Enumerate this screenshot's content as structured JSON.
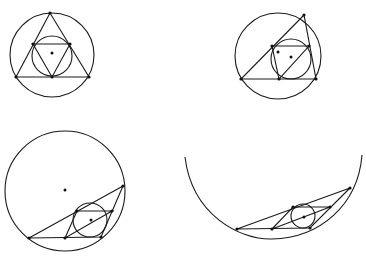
{
  "diagram": {
    "stroke_color": "#1a1a1a",
    "background": "#ffffff",
    "figures": [
      {
        "id": "fig1",
        "outer_circle": {
          "cx": 52,
          "cy": 55,
          "r": 42
        },
        "triangle": [
          [
            50,
            13
          ],
          [
            16,
            77
          ],
          [
            89,
            77
          ]
        ],
        "incircle": {
          "cx": 52,
          "cy": 56,
          "r": 20
        },
        "inner_triangle": [
          [
            33,
            44
          ],
          [
            70,
            44
          ],
          [
            52,
            77
          ]
        ],
        "center_dots": [
          [
            52,
            53
          ]
        ],
        "vertex_dots": [
          [
            50,
            13
          ],
          [
            16,
            77
          ],
          [
            89,
            77
          ],
          [
            33,
            44
          ],
          [
            70,
            44
          ],
          [
            52,
            77
          ]
        ]
      },
      {
        "id": "fig2",
        "outer_circle": {
          "cx": 278,
          "cy": 56,
          "r": 43
        },
        "triangle": [
          [
            304,
            15
          ],
          [
            241,
            79
          ],
          [
            316,
            79
          ]
        ],
        "incircle": {
          "cx": 291,
          "cy": 59,
          "r": 20
        },
        "inner_triangle": [
          [
            272,
            46
          ],
          [
            309,
            46
          ],
          [
            279,
            79
          ]
        ],
        "center_dots": [
          [
            278,
            52
          ],
          [
            291,
            57
          ]
        ],
        "vertex_dots": [
          [
            304,
            15
          ],
          [
            241,
            79
          ],
          [
            316,
            79
          ],
          [
            272,
            46
          ],
          [
            309,
            46
          ],
          [
            279,
            79
          ]
        ]
      },
      {
        "id": "fig3",
        "outer_circle": {
          "cx": 65,
          "cy": 191,
          "r": 60
        },
        "triangle": [
          [
            123,
            186
          ],
          [
            29,
            238
          ],
          [
            101,
            237
          ]
        ],
        "incircle": {
          "cx": 90,
          "cy": 220,
          "r": 17
        },
        "inner_triangle": [
          [
            77,
            211
          ],
          [
            112,
            211
          ],
          [
            65,
            238
          ]
        ],
        "center_dots": [
          [
            65,
            190
          ],
          [
            91,
            220
          ]
        ],
        "vertex_dots": [
          [
            123,
            186
          ],
          [
            29,
            238
          ],
          [
            101,
            237
          ],
          [
            77,
            211
          ],
          [
            112,
            211
          ],
          [
            65,
            238
          ]
        ]
      },
      {
        "id": "fig4",
        "arc": {
          "start": [
            185,
            157
          ],
          "end": [
            362,
            155
          ],
          "bottom_y": 239
        },
        "triangle": [
          [
            350,
            188
          ],
          [
            237,
            229
          ],
          [
            310,
            228
          ]
        ],
        "incircle": {
          "cx": 303,
          "cy": 216,
          "r": 12
        },
        "inner_triangle": [
          [
            293,
            207
          ],
          [
            330,
            207
          ],
          [
            272,
            229
          ]
        ],
        "center_dots": [
          [
            304,
            217
          ]
        ],
        "vertex_dots": [
          [
            350,
            188
          ],
          [
            237,
            229
          ],
          [
            310,
            228
          ],
          [
            293,
            207
          ],
          [
            330,
            207
          ],
          [
            272,
            229
          ]
        ]
      }
    ]
  }
}
